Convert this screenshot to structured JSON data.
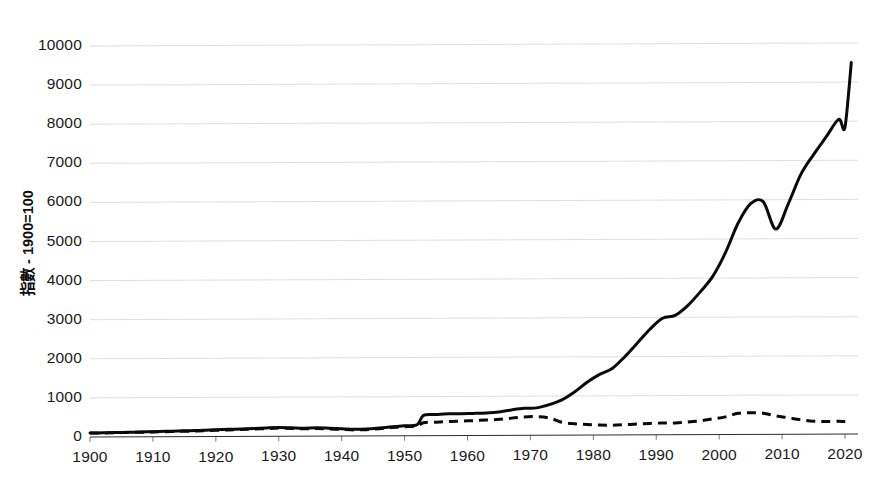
{
  "chart_data": {
    "type": "line",
    "title": "",
    "subtitle": "",
    "xlabel": "",
    "ylabel": "指數 - 1900=100",
    "xlim": [
      1900,
      2021
    ],
    "ylim": [
      0,
      10000
    ],
    "grid": true,
    "legend": "none",
    "xticks": [
      "1900",
      "1910",
      "1920",
      "1930",
      "1940",
      "1950",
      "1960",
      "1970",
      "1980",
      "1990",
      "2000",
      "2010",
      "2020"
    ],
    "yticks": [
      "0",
      "1000",
      "2000",
      "3000",
      "4000",
      "5000",
      "6000",
      "7000",
      "8000",
      "9000",
      "10000"
    ],
    "x": [
      1900,
      1902,
      1904,
      1906,
      1908,
      1910,
      1912,
      1914,
      1916,
      1918,
      1920,
      1922,
      1924,
      1926,
      1928,
      1930,
      1932,
      1934,
      1936,
      1938,
      1940,
      1942,
      1944,
      1946,
      1948,
      1950,
      1952,
      1953,
      1955,
      1957,
      1959,
      1961,
      1963,
      1965,
      1967,
      1969,
      1971,
      1973,
      1975,
      1977,
      1979,
      1981,
      1983,
      1985,
      1987,
      1989,
      1991,
      1993,
      1995,
      1997,
      1999,
      2001,
      2003,
      2005,
      2007,
      2009,
      2011,
      2013,
      2015,
      2017,
      2019,
      2020,
      2021
    ],
    "series": [
      {
        "name": "solid-series",
        "style": "solid",
        "color": "#0a0a0a",
        "values": [
          100,
          105,
          110,
          118,
          122,
          130,
          138,
          145,
          152,
          160,
          175,
          182,
          190,
          200,
          215,
          225,
          215,
          205,
          212,
          200,
          185,
          170,
          175,
          200,
          230,
          255,
          280,
          520,
          540,
          555,
          560,
          565,
          575,
          600,
          650,
          690,
          700,
          780,
          900,
          1100,
          1350,
          1550,
          1700,
          2000,
          2350,
          2700,
          2980,
          3050,
          3300,
          3650,
          4050,
          4650,
          5400,
          5900,
          5950,
          5250,
          5900,
          6650,
          7150,
          7600,
          8050,
          7850,
          9500
        ]
      },
      {
        "name": "dashed-series",
        "style": "dashed",
        "color": "#0a0a0a",
        "values": [
          100,
          102,
          106,
          112,
          116,
          122,
          128,
          134,
          140,
          148,
          160,
          168,
          175,
          185,
          198,
          208,
          198,
          188,
          195,
          182,
          168,
          155,
          160,
          182,
          210,
          232,
          255,
          330,
          345,
          360,
          370,
          380,
          395,
          410,
          440,
          470,
          475,
          440,
          330,
          290,
          270,
          255,
          250,
          260,
          275,
          290,
          300,
          300,
          320,
          350,
          400,
          450,
          540,
          555,
          540,
          470,
          420,
          370,
          330,
          320,
          325,
          320,
          330
        ]
      }
    ],
    "annotations": []
  },
  "axes": {
    "y_label_text": "指數 - 1900=100"
  }
}
